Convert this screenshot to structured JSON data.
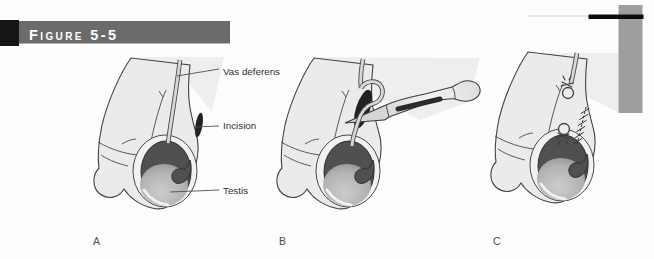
{
  "figure_header": {
    "title": "Figure 5-5"
  },
  "labels": {
    "vas_deferens": "Vas deferens",
    "incision": "Incision",
    "testis": "Testis"
  },
  "panels": {
    "a": "A",
    "b": "B",
    "c": "C"
  },
  "colors": {
    "header_block": "#161616",
    "header_bar": "#6b6b6b",
    "header_text": "#ffffff",
    "top_rule": "#0c0c0c",
    "side_bar": "#9e9e9e",
    "body_fill": "#ebebeb",
    "outline": "#424242",
    "epididymis_dark": "#505052",
    "testis_light": "#c9c9c9",
    "incision_dark": "#222222",
    "label_text": "#2f2f2f"
  }
}
